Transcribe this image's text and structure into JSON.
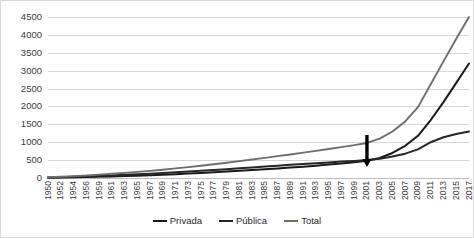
{
  "chart_data": {
    "type": "line",
    "title": "",
    "subtitle": "",
    "xlabel": "",
    "ylabel": "",
    "ylim": [
      0,
      4500
    ],
    "ytick_values": [
      0,
      500,
      1000,
      1500,
      2000,
      2500,
      3000,
      3500,
      4000,
      4500
    ],
    "ytick_labels": [
      "0",
      "500",
      "1000",
      "1500",
      "2000",
      "2500",
      "3000",
      "3500",
      "4000",
      "4500"
    ],
    "grid": true,
    "legend_position": "bottom",
    "categories": [
      "1950",
      "1952",
      "1954",
      "1956",
      "1959",
      "1961",
      "1963",
      "1965",
      "1967",
      "1969",
      "1971",
      "1973",
      "1975",
      "1977",
      "1979",
      "1981",
      "1983",
      "1985",
      "1987",
      "1989",
      "1991",
      "1993",
      "1995",
      "1997",
      "1999",
      "2001",
      "2003",
      "2005",
      "2007",
      "2009",
      "2011",
      "2013",
      "2015",
      "2017"
    ],
    "series": [
      {
        "name": "Privada",
        "color": "#1a1a1a",
        "values": [
          8,
          14,
          20,
          26,
          36,
          45,
          55,
          66,
          78,
          92,
          108,
          124,
          142,
          160,
          180,
          200,
          222,
          244,
          266,
          290,
          316,
          344,
          374,
          406,
          440,
          480,
          560,
          700,
          900,
          1180,
          1620,
          2120,
          2660,
          3200
        ]
      },
      {
        "name": "Pública",
        "color": "#262626",
        "values": [
          14,
          22,
          32,
          42,
          58,
          72,
          88,
          104,
          122,
          140,
          160,
          180,
          202,
          224,
          248,
          272,
          296,
          320,
          344,
          368,
          392,
          414,
          436,
          458,
          478,
          500,
          540,
          600,
          680,
          800,
          1000,
          1140,
          1230,
          1300
        ]
      },
      {
        "name": "Total",
        "color": "#6e6e6e",
        "values": [
          22,
          36,
          52,
          68,
          94,
          117,
          143,
          170,
          200,
          232,
          268,
          304,
          344,
          384,
          428,
          472,
          518,
          564,
          610,
          658,
          708,
          758,
          810,
          864,
          918,
          980,
          1100,
          1300,
          1580,
          1980,
          2620,
          3260,
          3890,
          4500
        ]
      }
    ],
    "annotations": [
      {
        "type": "arrow",
        "direction": "down",
        "at_category": "2001",
        "label": ""
      }
    ]
  }
}
